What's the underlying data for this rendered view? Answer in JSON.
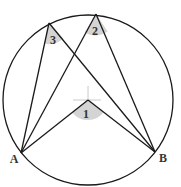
{
  "diagram": {
    "colors": {
      "stroke": "#1a1a1a",
      "angle_fill": "#d4d4d4",
      "crosshair": "#bdbdbd",
      "background": "#ffffff"
    },
    "circle": {
      "cx": 88,
      "cy": 100,
      "r": 85
    },
    "points": {
      "A": {
        "label": "A",
        "x": 21,
        "y": 153
      },
      "B": {
        "label": "B",
        "x": 155,
        "y": 152
      },
      "P2": {
        "x": 96,
        "y": 14
      },
      "P3": {
        "x": 49,
        "y": 23
      },
      "O": {
        "x": 88,
        "y": 100
      }
    },
    "angles": [
      {
        "label": "1",
        "vertex": "O",
        "type": "central"
      },
      {
        "label": "2",
        "vertex": "P2",
        "type": "inscribed"
      },
      {
        "label": "3",
        "vertex": "P3",
        "type": "inscribed"
      }
    ]
  }
}
